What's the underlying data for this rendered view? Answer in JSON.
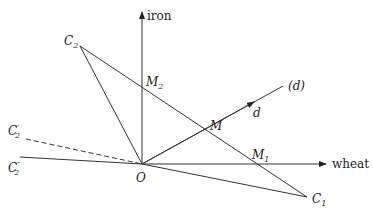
{
  "diagram": {
    "axes": {
      "vertical_label": "iron",
      "horizontal_label": "wheat"
    },
    "points": {
      "origin": "O",
      "C1": {
        "base": "C",
        "sub": "1"
      },
      "C2": {
        "base": "C",
        "sub": "2"
      },
      "C2_prime": {
        "base": "C",
        "sub": "2",
        "prime": "′"
      },
      "C2_double_prime": {
        "base": "C",
        "sub": "2",
        "prime": "″"
      },
      "M": "M",
      "M1": {
        "base": "M",
        "sub": "1"
      },
      "M2": {
        "base": "M",
        "sub": "2"
      }
    },
    "line_labels": {
      "direction_arrow": "d",
      "line_d": "(d)"
    },
    "colors": {
      "line": "#333333",
      "background": "#ffffff"
    }
  }
}
